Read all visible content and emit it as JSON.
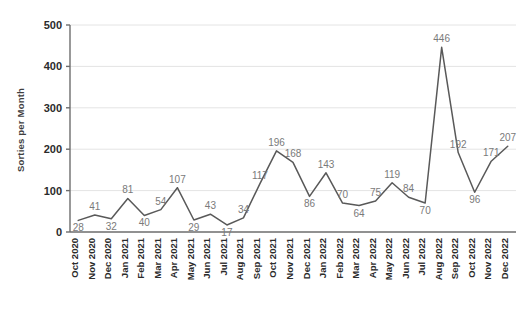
{
  "chart_data": {
    "type": "line",
    "title": "",
    "xlabel": "",
    "ylabel": "Sorties per Month",
    "ylim": [
      0,
      500
    ],
    "yticks": [
      0,
      100,
      200,
      300,
      400,
      500
    ],
    "grid": true,
    "legend": "none",
    "data_labels": true,
    "line_color": "#595959",
    "label_color": "#7a7a7a",
    "gridline_color": "#e4e4e4",
    "axis_color": "#6d6d6d",
    "background": "#ffffff",
    "categories": [
      "Oct 2020",
      "Nov 2020",
      "Dec 2020",
      "Jan 2021",
      "Feb 2021",
      "Mar 2021",
      "Apr 2021",
      "May 2021",
      "Jun 2021",
      "Jul 2021",
      "Aug 2021",
      "Sep 2021",
      "Oct 2021",
      "Nov 2021",
      "Dec 2021",
      "Jan 2022",
      "Feb 2022",
      "Mar 2022",
      "Apr 2022",
      "May 2022",
      "Jun 2022",
      "Jul 2022",
      "Aug 2022",
      "Sep 2022",
      "Oct 2022",
      "Nov 2022",
      "Dec 2022"
    ],
    "values": [
      28,
      41,
      32,
      81,
      40,
      54,
      107,
      29,
      43,
      17,
      34,
      117,
      196,
      168,
      86,
      143,
      70,
      64,
      75,
      119,
      84,
      70,
      446,
      192,
      96,
      171,
      207
    ]
  }
}
